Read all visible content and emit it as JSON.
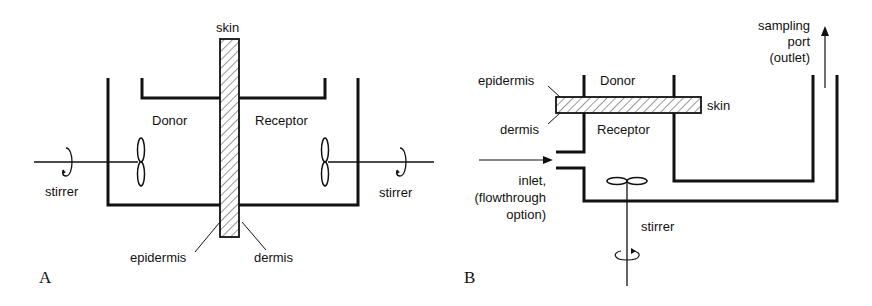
{
  "figure": {
    "panel_a": {
      "letter": "A",
      "labels": {
        "skin": "skin",
        "donor": "Donor",
        "receptor": "Receptor",
        "stirrer_left": "stirrer",
        "stirrer_right": "stirrer",
        "epidermis": "epidermis",
        "dermis": "dermis"
      }
    },
    "panel_b": {
      "letter": "B",
      "labels": {
        "sampling_line1": "sampling",
        "sampling_line2": "port",
        "sampling_line3": "(outlet)",
        "epidermis": "epidermis",
        "dermis": "dermis",
        "donor": "Donor",
        "receptor": "Receptor",
        "skin": "skin",
        "inlet_line1": "inlet,",
        "inlet_line2": "(flowthrough",
        "inlet_line3": "option)",
        "stirrer": "stirrer"
      }
    },
    "colors": {
      "stroke": "#111111",
      "hatch": "#333333",
      "background": "#ffffff"
    }
  }
}
